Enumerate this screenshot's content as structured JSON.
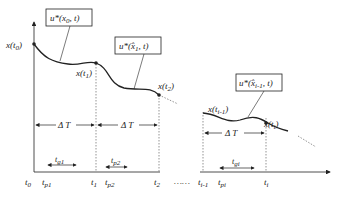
{
  "diagram": {
    "boxes": [
      {
        "id": "u0",
        "text": "u*(x₀, t)"
      },
      {
        "id": "u1",
        "text": "u*(x̂₁, t)"
      },
      {
        "id": "ui",
        "text": "u*(x̂ᵢ₋₁, t)"
      }
    ],
    "state_labels": [
      "x(t₀)",
      "x(t₁)",
      "x(t₂)",
      "x(tᵢ₋₁)",
      "x(tᵢ)"
    ],
    "interval_label": "ΔT",
    "axis_ticks": [
      "t₀",
      "t_p1",
      "t₁",
      "t_p2",
      "t₂",
      "……",
      "tᵢ₋₁",
      "t_pi",
      "tᵢ"
    ],
    "gap_labels": [
      "t_g1",
      "t_p2",
      "t_gi"
    ],
    "colors": {
      "line": "#222222",
      "dotted": "#666666",
      "background": "#ffffff"
    }
  }
}
